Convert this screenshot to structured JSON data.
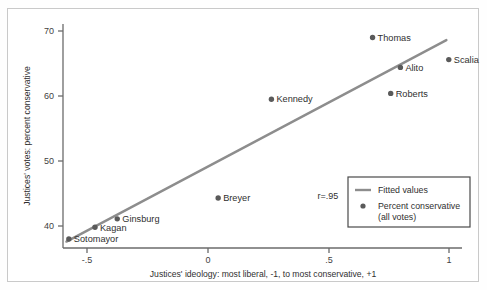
{
  "chart_data": {
    "type": "scatter",
    "title": "",
    "xlabel": "Justices' ideology: most liberal, -1, to most conservative, +1",
    "ylabel": "Justices' votes: percent conservative",
    "xlim": [
      -0.62,
      1.08
    ],
    "ylim": [
      36.5,
      71.5
    ],
    "xticks": [
      -0.5,
      0,
      0.5,
      1
    ],
    "xticklabels": [
      "-.5",
      "0",
      ".5",
      "1"
    ],
    "yticks": [
      40,
      50,
      60,
      70
    ],
    "yticklabels": [
      "40",
      "50",
      "60",
      "70"
    ],
    "grid": false,
    "legend_position": "lower right",
    "annotations": [
      {
        "text": "r=.95",
        "x": 0.4,
        "y": 44.0
      }
    ],
    "points": [
      {
        "label": "Sotomayor",
        "x": -0.575,
        "y": 38.0,
        "label_pos": "right"
      },
      {
        "label": "Kagan",
        "x": -0.467,
        "y": 39.8,
        "label_pos": "right"
      },
      {
        "label": "Ginsburg",
        "x": -0.375,
        "y": 41.1,
        "label_pos": "right"
      },
      {
        "label": "Breyer",
        "x": 0.042,
        "y": 44.3,
        "label_pos": "right"
      },
      {
        "label": "Kennedy",
        "x": 0.262,
        "y": 59.5,
        "label_pos": "right"
      },
      {
        "label": "Thomas",
        "x": 0.68,
        "y": 69.0,
        "label_pos": "right"
      },
      {
        "label": "Alito",
        "x": 0.795,
        "y": 64.4,
        "label_pos": "right"
      },
      {
        "label": "Roberts",
        "x": 0.755,
        "y": 60.4,
        "label_pos": "right"
      },
      {
        "label": "Scalia",
        "x": 0.995,
        "y": 65.6,
        "label_pos": "right"
      }
    ],
    "series": [
      {
        "name": "Percent conservative (all votes)",
        "type": "scatter",
        "x": [
          -0.575,
          -0.467,
          -0.375,
          0.042,
          0.262,
          0.68,
          0.795,
          0.755,
          0.995
        ],
        "values": [
          38.0,
          39.8,
          41.1,
          44.3,
          59.5,
          69.0,
          64.4,
          60.4,
          65.6
        ],
        "color": "#5a5a5a"
      },
      {
        "name": "Fitted values",
        "type": "line",
        "x": [
          -0.585,
          0.985
        ],
        "values": [
          37.6,
          68.6
        ],
        "color": "#8d8d8d"
      }
    ],
    "correlation": "r=.95"
  },
  "legend": {
    "entries": [
      {
        "label": "Fitted values",
        "marker": "line",
        "color": "#8d8d8d"
      },
      {
        "label": "Percent conservative",
        "label2": "(all votes)",
        "marker": "dot",
        "color": "#5a5a5a"
      }
    ]
  },
  "axis": {
    "x_title": "Justices' ideology: most liberal, -1, to most conservative, +1",
    "y_title": "Justices' votes: percent conservative",
    "x_tick_labels": [
      "-.5",
      "0",
      ".5",
      "1"
    ],
    "y_tick_labels": [
      "40",
      "50",
      "60",
      "70"
    ]
  },
  "colors": {
    "point": "#5a5a5a",
    "line": "#8d8d8d",
    "axis": "#6b6b6b",
    "frame": "#c9c9c9",
    "text": "#2f2f2f",
    "background": "#ffffff"
  }
}
